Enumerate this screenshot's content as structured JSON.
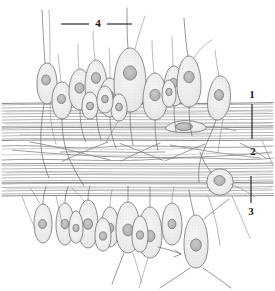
{
  "figure": {
    "kind": "histology-line-drawing",
    "background_color": "#ffffff",
    "ink_color": "#6b6b6b",
    "label_color": "#1a1a1a",
    "cell_fill_color": "#ededed",
    "nucleus_fill_color": "#b9b9b9",
    "fiber_color": "#8a8a8a",
    "labels": [
      {
        "id": "label-1",
        "text": "1",
        "x": 252,
        "y": 95,
        "leader": "vertical",
        "leader_x": 252,
        "leader_y1": 104,
        "leader_y2": 139,
        "points_to": "upper-fiber-band"
      },
      {
        "id": "label-2",
        "text": "2",
        "x": 253,
        "y": 152,
        "leader": "none",
        "points_to": "middle-loose-fiber-layer"
      },
      {
        "id": "label-3",
        "text": "3",
        "x": 251,
        "y": 212,
        "leader": "vertical",
        "leader_x": 251,
        "leader_y1": 176,
        "leader_y2": 203,
        "points_to": "lower-fiber-band"
      },
      {
        "id": "label-4",
        "text": "4",
        "x": 98,
        "y": 24,
        "leader": "horizontal-both",
        "leader_y": 24,
        "leader_x_left": 61,
        "leader_x_right": 132,
        "points_to": "apical-processes"
      }
    ],
    "structures": [
      {
        "name": "upper-fiber-band",
        "y_top": 103,
        "y_bottom": 140
      },
      {
        "name": "middle-loose-fiber-layer",
        "y_top": 140,
        "y_bottom": 163
      },
      {
        "name": "lower-fiber-band",
        "y_top": 163,
        "y_bottom": 196
      },
      {
        "name": "upper-cell-row",
        "count": 14
      },
      {
        "name": "lower-cell-row",
        "count": 11
      },
      {
        "name": "round-cell",
        "cx": 220,
        "cy": 182,
        "r": 13
      },
      {
        "name": "flattened-intraband-cell",
        "cx": 186,
        "cy": 126
      }
    ]
  }
}
